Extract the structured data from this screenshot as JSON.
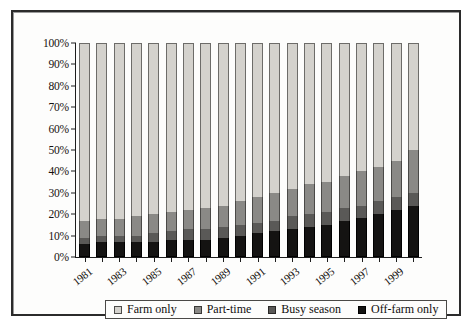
{
  "chart_data": {
    "type": "bar",
    "stacked": true,
    "stack_mode": "percent",
    "title": "",
    "subtitle": "",
    "xlabel": "",
    "ylabel": "",
    "ylim": [
      0,
      100
    ],
    "grid": false,
    "legend_position": "bottom",
    "categories": [
      "1981",
      "1982",
      "1983",
      "1984",
      "1985",
      "1986",
      "1987",
      "1988",
      "1989",
      "1990",
      "1991",
      "1992",
      "1993",
      "1994",
      "1995",
      "1996",
      "1997",
      "1998",
      "1999",
      "2000"
    ],
    "xtick_labels": [
      "1981",
      "",
      "1983",
      "",
      "1985",
      "",
      "1987",
      "",
      "1989",
      "",
      "1991",
      "",
      "1993",
      "",
      "1995",
      "",
      "1997",
      "",
      "1999",
      ""
    ],
    "ytick_labels": [
      "0%",
      "10%",
      "20%",
      "30%",
      "40%",
      "50%",
      "60%",
      "70%",
      "80%",
      "90%",
      "100%"
    ],
    "ytick_values": [
      0,
      10,
      20,
      30,
      40,
      50,
      60,
      70,
      80,
      90,
      100
    ],
    "series": [
      {
        "name": "Off-farm only",
        "color": "#141312",
        "values": [
          6,
          7,
          7,
          7,
          7,
          8,
          8,
          8,
          9,
          10,
          11,
          12,
          13,
          14,
          15,
          17,
          18,
          20,
          22,
          24
        ]
      },
      {
        "name": "Busy season",
        "color": "#5a5957",
        "values": [
          3,
          3,
          3,
          3,
          4,
          4,
          5,
          5,
          5,
          5,
          5,
          5,
          6,
          6,
          6,
          6,
          6,
          6,
          6,
          6
        ]
      },
      {
        "name": "Part-time",
        "color": "#8a8986",
        "values": [
          8,
          8,
          8,
          9,
          9,
          9,
          9,
          10,
          10,
          11,
          12,
          13,
          13,
          14,
          14,
          15,
          16,
          16,
          17,
          20
        ]
      },
      {
        "name": "Farm only",
        "color": "#d4d2cd",
        "values": [
          83,
          82,
          82,
          81,
          80,
          79,
          78,
          77,
          76,
          74,
          72,
          70,
          68,
          66,
          65,
          62,
          60,
          58,
          55,
          50
        ]
      }
    ],
    "stack_order_bottom_to_top": [
      "Off-farm only",
      "Busy season",
      "Part-time",
      "Farm only"
    ]
  },
  "legend": {
    "items": [
      {
        "label": "Farm only",
        "swatch": "farm"
      },
      {
        "label": "Part-time",
        "swatch": "part"
      },
      {
        "label": "Busy season",
        "swatch": "busy"
      },
      {
        "label": "Off-farm only",
        "swatch": "off"
      }
    ]
  }
}
